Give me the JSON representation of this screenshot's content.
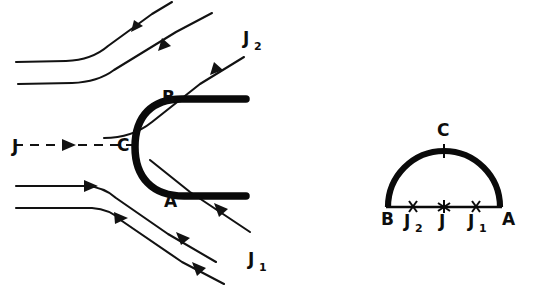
{
  "figure": {
    "caption": "",
    "background_color": "#ffffff",
    "ink_color": "#0d0d0d"
  },
  "left_panel": {
    "name": "bow-shock-streamline-diagram",
    "description": "Incoming flow streamlines deflected around a blunt C-shaped shock front",
    "labels": {
      "incoming_current": "J",
      "upper_branch": "J",
      "upper_branch_sub": "2",
      "lower_branch": "J",
      "lower_branch_sub": "1",
      "point_b": "B",
      "point_c": "C",
      "point_a": "A"
    },
    "shock_front": {
      "name": "shock-front-curve",
      "style": "thick-solid",
      "stroke_color": "#0a0a0a",
      "stroke_width": 7.5,
      "shape": "backwards-C with straight horizontal tails to the right"
    },
    "streamlines": [
      {
        "id": "upper-outer",
        "direction": "left-to-right, deflects upward",
        "arrows": 1
      },
      {
        "id": "upper-inner",
        "direction": "left-to-right, deflects upward",
        "arrows": 1
      },
      {
        "id": "upper-tangent",
        "direction": "left-to-right, deflects upward",
        "arrows": 1
      },
      {
        "id": "center-dashed",
        "direction": "left-to-right, straight to point C",
        "arrows": 1,
        "style": "dashed"
      },
      {
        "id": "lower-inner",
        "direction": "left-to-right, deflects downward",
        "arrows": 2
      },
      {
        "id": "lower-outer",
        "direction": "left-to-right, deflects downward",
        "arrows": 2
      }
    ]
  },
  "right_panel": {
    "name": "semicircle-shock-diagram",
    "description": "Semicircular arc from B to A with apex C and marked points on the diameter",
    "labels": {
      "left_end": "B",
      "apex": "C",
      "right_end": "A",
      "mark_left": "J",
      "mark_left_sub": "2",
      "mark_center": "J",
      "mark_right": "J",
      "mark_right_sub": "1"
    },
    "markers": [
      {
        "id": "J2",
        "glyph": "cross",
        "position": "left of center on diameter"
      },
      {
        "id": "J",
        "glyph": "asterisk",
        "position": "center of diameter"
      },
      {
        "id": "J1",
        "glyph": "cross",
        "position": "right of center on diameter"
      },
      {
        "id": "C",
        "glyph": "tick",
        "position": "apex of arc"
      }
    ],
    "geometry": {
      "arc_type": "semicircle",
      "arc_stroke_width": 6.2,
      "baseline_stroke_width": 2.6
    }
  }
}
